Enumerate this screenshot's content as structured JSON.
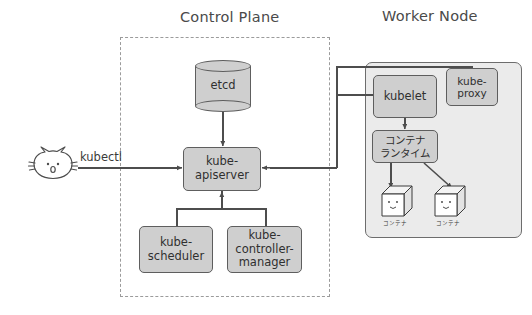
{
  "diagram": {
    "background_color": "#ffffff",
    "box_fill": "#cfcfcf",
    "box_stroke": "#5e5e5e",
    "node_fill": "#ebebeb",
    "line_color": "#4d4d4d",
    "dashed_border_color": "#9b9b9b"
  },
  "control_plane": {
    "title": "Control Plane",
    "components": {
      "etcd": "etcd",
      "kube_apiserver": "kube-\napiserver",
      "kube_scheduler": "kube-\nscheduler",
      "kube_controller_manager": "kube-\ncontroller-\nmanager"
    }
  },
  "worker_node": {
    "title": "Worker Node",
    "components": {
      "kubelet": "kubelet",
      "kube_proxy": "kube-\nproxy",
      "container_runtime": "コンテナ\nランタイム"
    },
    "containers": [
      {
        "label": "コンテナ"
      },
      {
        "label": "コンテナ"
      }
    ]
  },
  "client": {
    "icon": "cat-face-icon",
    "command_label": "kubectl"
  }
}
